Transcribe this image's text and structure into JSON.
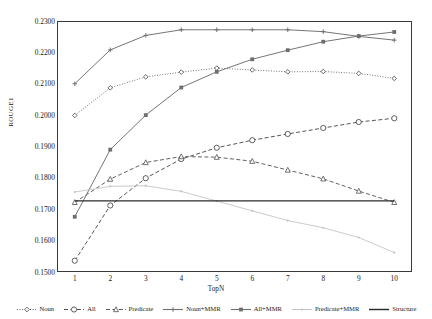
{
  "chart_data": {
    "type": "line",
    "title": "",
    "xlabel": "TopN",
    "ylabel": "ROUGE1",
    "x": [
      1,
      2,
      3,
      4,
      5,
      6,
      7,
      8,
      9,
      10
    ],
    "categories": [
      "1",
      "2",
      "3",
      "4",
      "5",
      "6",
      "7",
      "8",
      "9",
      "10"
    ],
    "xlim": [
      0.5,
      10.5
    ],
    "ylim": [
      0.15,
      0.23
    ],
    "yticks": [
      "0.1500",
      "0.1600",
      "0.1700",
      "0.1800",
      "0.1900",
      "0.2000",
      "0.2100",
      "0.2200",
      "0.2300"
    ],
    "ytick_values": [
      0.15,
      0.16,
      0.17,
      0.18,
      0.19,
      0.2,
      0.21,
      0.22,
      0.23
    ],
    "grid": false,
    "legend_position": "bottom",
    "series": [
      {
        "name": "Noun",
        "style": "dotted",
        "marker": "diamond-open",
        "color": "#4d4d4d",
        "values": [
          0.1999,
          0.2087,
          0.2122,
          0.2137,
          0.215,
          0.2144,
          0.2138,
          0.2139,
          0.2133,
          0.2117
        ]
      },
      {
        "name": "All",
        "style": "dashed",
        "marker": "circle-open",
        "color": "#4d4d4d",
        "values": [
          0.1536,
          0.1712,
          0.1799,
          0.186,
          0.1896,
          0.192,
          0.194,
          0.1959,
          0.1978,
          0.199
        ]
      },
      {
        "name": "Predicate",
        "style": "dashed",
        "marker": "triangle-open",
        "color": "#5a5a5a",
        "values": [
          0.1722,
          0.1796,
          0.1849,
          0.1868,
          0.1866,
          0.1853,
          0.1825,
          0.1797,
          0.1758,
          0.1722
        ]
      },
      {
        "name": "Noun+MMR",
        "style": "solid",
        "marker": "plus",
        "color": "#6e6e6e",
        "values": [
          0.21,
          0.2208,
          0.2254,
          0.2272,
          0.2272,
          0.2272,
          0.2272,
          0.2266,
          0.2251,
          0.2239
        ]
      },
      {
        "name": "All+MMR",
        "style": "solid",
        "marker": "square",
        "color": "#6e6e6e",
        "values": [
          0.1676,
          0.189,
          0.2,
          0.2088,
          0.2138,
          0.2178,
          0.2207,
          0.2234,
          0.2252,
          0.2265
        ]
      },
      {
        "name": "Predicate+MMR",
        "style": "solid-light",
        "marker": "dot",
        "color": "#c2c2c2",
        "values": [
          0.1755,
          0.1773,
          0.1775,
          0.1757,
          0.1726,
          0.1695,
          0.1664,
          0.1641,
          0.161,
          0.1562
        ]
      },
      {
        "name": "Structure",
        "style": "solid-dark",
        "marker": "none",
        "color": "#2b2b2b",
        "values": [
          0.1727,
          0.1727,
          0.1727,
          0.1727,
          0.1727,
          0.1727,
          0.1727,
          0.1727,
          0.1727,
          0.1727
        ]
      }
    ]
  },
  "legend": {
    "items": [
      {
        "label": "Noun"
      },
      {
        "label": "All"
      },
      {
        "label": "Predicate"
      },
      {
        "label": "Noun+MMR"
      },
      {
        "label": "All+MMR"
      },
      {
        "label": "Predicate+MMR"
      },
      {
        "label": "Structure"
      }
    ]
  }
}
